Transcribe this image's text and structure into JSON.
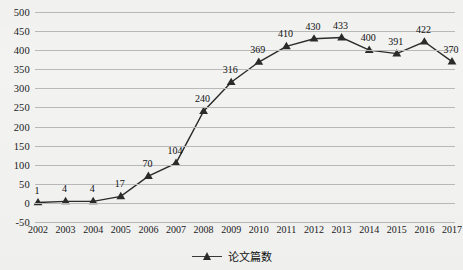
{
  "chart_data": {
    "type": "line",
    "title": "",
    "xlabel": "",
    "ylabel": "",
    "categories": [
      "2002",
      "2003",
      "2004",
      "2005",
      "2006",
      "2007",
      "2008",
      "2009",
      "2010",
      "2011",
      "2012",
      "2013",
      "2014",
      "2015",
      "2016",
      "2017"
    ],
    "values": [
      1,
      4,
      4,
      17,
      70,
      104,
      240,
      316,
      369,
      410,
      430,
      433,
      400,
      391,
      422,
      370
    ],
    "series": [
      {
        "name": "论文篇数",
        "values": [
          1,
          4,
          4,
          17,
          70,
          104,
          240,
          316,
          369,
          410,
          430,
          433,
          400,
          391,
          422,
          370
        ],
        "marker": "triangle",
        "color": "#2b2b2b"
      }
    ],
    "ylim": [
      -50,
      500
    ],
    "yticks": [
      -50,
      0,
      50,
      100,
      150,
      200,
      250,
      300,
      350,
      400,
      450,
      500
    ],
    "ytick_labels": [
      "-50",
      "0",
      "50",
      "100",
      "150",
      "200",
      "250",
      "300",
      "350",
      "400",
      "450",
      "500"
    ],
    "grid": true,
    "data_labels": [
      "1",
      "4",
      "4",
      "17",
      "70",
      "104",
      "240",
      "316",
      "369",
      "410",
      "430",
      "433",
      "400",
      "391",
      "422",
      "370"
    ],
    "legend_position": "bottom-center"
  },
  "legend": {
    "entries": [
      {
        "label": "论文篇数",
        "marker_icon": "triangle-marker-icon"
      }
    ]
  },
  "colors": {
    "series": "#2b2b2b",
    "gridline": "#b9b9b9",
    "background": "#f3f3f2",
    "text": "#1a1a1a"
  }
}
